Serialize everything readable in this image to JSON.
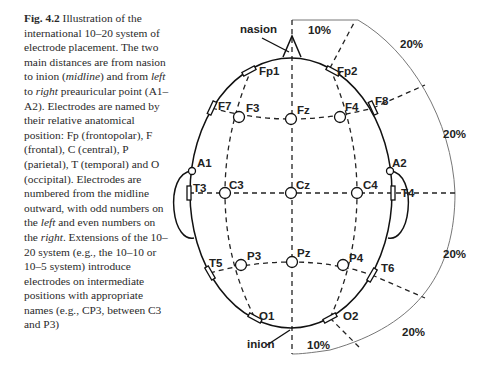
{
  "caption": {
    "figure_label": "Fig. 4.2",
    "segments": [
      {
        "text": " Illustration of the international 10–20 system of electrode placement. The two main distances are from nasion to inion (",
        "italic": false
      },
      {
        "text": "midline",
        "italic": true
      },
      {
        "text": ") and from ",
        "italic": false
      },
      {
        "text": "left",
        "italic": true
      },
      {
        "text": " to ",
        "italic": false
      },
      {
        "text": "right",
        "italic": true
      },
      {
        "text": " preauricular point (A1–A2). Electrodes are named by their relative anatomical position: Fp (frontopolar), F (frontal), C (central), P (parietal), T (temporal) and O (occipital). Electrodes are numbered from the midline outward, with odd numbers on the ",
        "italic": false
      },
      {
        "text": "left",
        "italic": true
      },
      {
        "text": " and even numbers on the ",
        "italic": false
      },
      {
        "text": "right",
        "italic": true
      },
      {
        "text": ". Extensions of the 10–20 system (e.g., the 10–10 or 10–5 system) introduce electrodes on intermediate positions with appropriate names (e.g., CP3, between C3 and P3)",
        "italic": false
      }
    ]
  },
  "diagram": {
    "landmarks": {
      "nasion": "nasion",
      "inion": "inion"
    },
    "percent_labels": {
      "top_midline": "10%",
      "bottom_midline": "10%",
      "arc_1": "20%",
      "arc_2": "20%",
      "arc_3": "20%",
      "arc_4": "20%"
    },
    "electrodes": {
      "Fp1": "Fp1",
      "Fp2": "Fp2",
      "F7": "F7",
      "F3": "F3",
      "Fz": "Fz",
      "F4": "F4",
      "F8": "F8",
      "A1": "A1",
      "A2": "A2",
      "T3": "T3",
      "C3": "C3",
      "Cz": "Cz",
      "C4": "C4",
      "T4": "T4",
      "T5": "T5",
      "P3": "P3",
      "Pz": "Pz",
      "P4": "P4",
      "T6": "T6",
      "O1": "O1",
      "O2": "O2"
    }
  }
}
